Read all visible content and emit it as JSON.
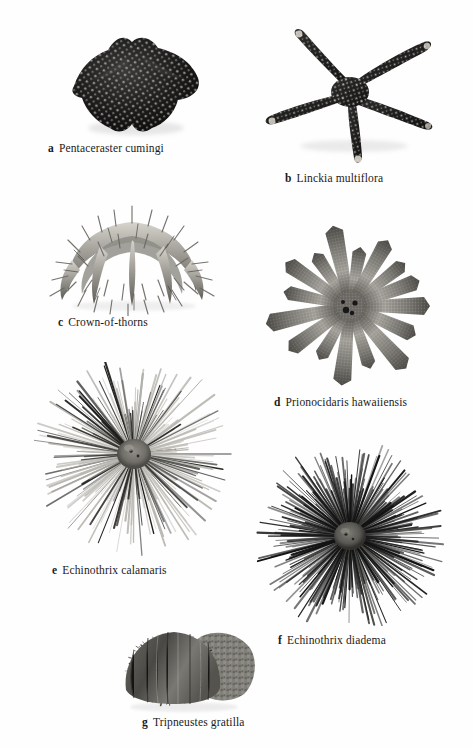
{
  "plate": {
    "title": "Echinoderm specimen plate",
    "background_color": "#fefefe",
    "text_color": "#1a1a1a"
  },
  "figures": [
    {
      "id": "a",
      "label": "a",
      "name": "Pentaceraster cumingi",
      "common_type": "sea-star",
      "icon": "starfish-thick-icon",
      "x": 52,
      "y": 28,
      "w": 158,
      "h": 112,
      "caption_x": 48,
      "caption_y": 142,
      "fill": "#141414",
      "dot_color": "#d9d4c8"
    },
    {
      "id": "b",
      "label": "b",
      "name": "Linckia multiflora",
      "common_type": "sea-star",
      "icon": "starfish-slender-icon",
      "x": 258,
      "y": 24,
      "w": 186,
      "h": 142,
      "caption_x": 285,
      "caption_y": 172,
      "fill": "#1b1b1b",
      "dot_color": "#e2ddd2"
    },
    {
      "id": "c",
      "label": "c",
      "name": "Crown-of-thorns",
      "common_type": "sea-star",
      "icon": "crown-of-thorns-icon",
      "x": 42,
      "y": 196,
      "w": 180,
      "h": 120,
      "caption_x": 58,
      "caption_y": 316,
      "fill": "#9a9a96",
      "dot_color": "#4a4a48"
    },
    {
      "id": "d",
      "label": "d",
      "name": "Prionocidaris hawaiiensis",
      "common_type": "sea-urchin",
      "icon": "pencil-urchin-icon",
      "x": 256,
      "y": 222,
      "w": 188,
      "h": 168,
      "caption_x": 274,
      "caption_y": 396,
      "fill": "#7e7e7a",
      "dot_color": "#3a3a38"
    },
    {
      "id": "e",
      "label": "e",
      "name": "Echinothrix calamaris",
      "common_type": "sea-urchin",
      "icon": "long-spine-urchin-light-icon",
      "x": 34,
      "y": 362,
      "w": 200,
      "h": 196,
      "caption_x": 52,
      "caption_y": 564,
      "fill": "#6f6f6c",
      "dot_color": "#2a2a28"
    },
    {
      "id": "f",
      "label": "f",
      "name": "Echinothrix diadema",
      "common_type": "sea-urchin",
      "icon": "long-spine-urchin-dark-icon",
      "x": 250,
      "y": 440,
      "w": 200,
      "h": 186,
      "caption_x": 278,
      "caption_y": 634,
      "fill": "#2b2b2b",
      "dot_color": "#111111"
    },
    {
      "id": "g",
      "label": "g",
      "name": "Tripneustes gratilla",
      "common_type": "sea-urchin",
      "icon": "short-spine-urchin-icon",
      "x": 112,
      "y": 604,
      "w": 150,
      "h": 110,
      "caption_x": 142,
      "caption_y": 716,
      "fill": "#6a6a66",
      "dot_color": "#2e2e2c"
    }
  ]
}
